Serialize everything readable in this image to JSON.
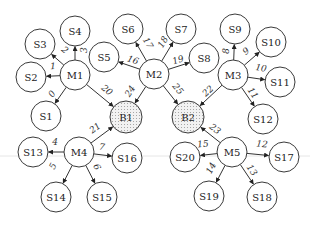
{
  "diagram": {
    "type": "network-topology",
    "nodes": [
      {
        "id": "M1",
        "label": "M1",
        "kind": "master",
        "x": 75,
        "y": 75,
        "r": 15
      },
      {
        "id": "M2",
        "label": "M2",
        "kind": "master",
        "x": 154,
        "y": 74,
        "r": 15
      },
      {
        "id": "M3",
        "label": "M3",
        "kind": "master",
        "x": 233,
        "y": 75,
        "r": 15
      },
      {
        "id": "M4",
        "label": "M4",
        "kind": "master",
        "x": 79,
        "y": 152,
        "r": 15
      },
      {
        "id": "M5",
        "label": "M5",
        "kind": "master",
        "x": 232,
        "y": 152,
        "r": 15
      },
      {
        "id": "B1",
        "label": "B1",
        "kind": "hub",
        "x": 126,
        "y": 117,
        "r": 16
      },
      {
        "id": "B2",
        "label": "B2",
        "kind": "hub",
        "x": 188,
        "y": 117,
        "r": 16
      },
      {
        "id": "S1",
        "label": "S1",
        "kind": "slave",
        "x": 46,
        "y": 116,
        "r": 15
      },
      {
        "id": "S2",
        "label": "S2",
        "kind": "slave",
        "x": 31,
        "y": 77,
        "r": 15
      },
      {
        "id": "S3",
        "label": "S3",
        "kind": "slave",
        "x": 40,
        "y": 44,
        "r": 15
      },
      {
        "id": "S4",
        "label": "S4",
        "kind": "slave",
        "x": 75,
        "y": 31,
        "r": 15
      },
      {
        "id": "S5",
        "label": "S5",
        "kind": "slave",
        "x": 104,
        "y": 57,
        "r": 15
      },
      {
        "id": "S6",
        "label": "S6",
        "kind": "slave",
        "x": 128,
        "y": 29,
        "r": 15
      },
      {
        "id": "S7",
        "label": "S7",
        "kind": "slave",
        "x": 181,
        "y": 29,
        "r": 15
      },
      {
        "id": "S8",
        "label": "S8",
        "kind": "slave",
        "x": 204,
        "y": 58,
        "r": 15
      },
      {
        "id": "S9",
        "label": "S9",
        "kind": "slave",
        "x": 235,
        "y": 29,
        "r": 15
      },
      {
        "id": "S10",
        "label": "S10",
        "kind": "slave",
        "x": 271,
        "y": 42,
        "r": 15
      },
      {
        "id": "S11",
        "label": "S11",
        "kind": "slave",
        "x": 280,
        "y": 82,
        "r": 15
      },
      {
        "id": "S12",
        "label": "S12",
        "kind": "slave",
        "x": 263,
        "y": 119,
        "r": 15
      },
      {
        "id": "S13",
        "label": "S13",
        "kind": "slave",
        "x": 33,
        "y": 152,
        "r": 15
      },
      {
        "id": "S14",
        "label": "S14",
        "kind": "slave",
        "x": 56,
        "y": 197,
        "r": 15
      },
      {
        "id": "S15",
        "label": "S15",
        "kind": "slave",
        "x": 102,
        "y": 197,
        "r": 15
      },
      {
        "id": "S16",
        "label": "S16",
        "kind": "slave",
        "x": 127,
        "y": 158,
        "r": 15
      },
      {
        "id": "S17",
        "label": "S17",
        "kind": "slave",
        "x": 284,
        "y": 157,
        "r": 15
      },
      {
        "id": "S18",
        "label": "S18",
        "kind": "slave",
        "x": 262,
        "y": 197,
        "r": 15
      },
      {
        "id": "S19",
        "label": "S19",
        "kind": "slave",
        "x": 209,
        "y": 196,
        "r": 15
      },
      {
        "id": "S20",
        "label": "S20",
        "kind": "slave",
        "x": 185,
        "y": 157,
        "r": 15
      }
    ],
    "edges": [
      {
        "label": "0",
        "from": "M1",
        "to": "S1",
        "lx": 52,
        "ly": 94
      },
      {
        "label": "1",
        "from": "M1",
        "to": "S2",
        "lx": 53,
        "ly": 66
      },
      {
        "label": "2",
        "from": "M1",
        "to": "S3",
        "lx": 65,
        "ly": 50
      },
      {
        "label": "3",
        "from": "M1",
        "to": "S4",
        "lx": 84,
        "ly": 50
      },
      {
        "label": "4",
        "from": "M4",
        "to": "S13",
        "lx": 55,
        "ly": 142
      },
      {
        "label": "5",
        "from": "M4",
        "to": "S14",
        "lx": 53,
        "ly": 166
      },
      {
        "label": "6",
        "from": "M4",
        "to": "S15",
        "lx": 97,
        "ly": 167
      },
      {
        "label": "7",
        "from": "M4",
        "to": "S16",
        "lx": 102,
        "ly": 147
      },
      {
        "label": "8",
        "from": "M3",
        "to": "S9",
        "lx": 226,
        "ly": 51
      },
      {
        "label": "9",
        "from": "M3",
        "to": "S10",
        "lx": 246,
        "ly": 51
      },
      {
        "label": "10",
        "from": "M3",
        "to": "S11",
        "lx": 261,
        "ly": 68
      },
      {
        "label": "11",
        "from": "M3",
        "to": "S12",
        "lx": 253,
        "ly": 93
      },
      {
        "label": "12",
        "from": "M5",
        "to": "S17",
        "lx": 262,
        "ly": 144
      },
      {
        "label": "13",
        "from": "M5",
        "to": "S18",
        "lx": 252,
        "ly": 170
      },
      {
        "label": "14",
        "from": "M5",
        "to": "S19",
        "lx": 211,
        "ly": 168
      },
      {
        "label": "15",
        "from": "M5",
        "to": "S20",
        "lx": 203,
        "ly": 144
      },
      {
        "label": "16",
        "from": "M2",
        "to": "S5",
        "lx": 133,
        "ly": 60
      },
      {
        "label": "17",
        "from": "M2",
        "to": "S6",
        "lx": 148,
        "ly": 43
      },
      {
        "label": "18",
        "from": "M2",
        "to": "S7",
        "lx": 163,
        "ly": 42
      },
      {
        "label": "19",
        "from": "M2",
        "to": "S8",
        "lx": 178,
        "ly": 60
      },
      {
        "label": "20",
        "from": "M1",
        "to": "B1",
        "lx": 107,
        "ly": 90
      },
      {
        "label": "21",
        "from": "M4",
        "to": "B1",
        "lx": 95,
        "ly": 128
      },
      {
        "label": "22",
        "from": "M3",
        "to": "B2",
        "lx": 208,
        "ly": 91
      },
      {
        "label": "23",
        "from": "M5",
        "to": "B2",
        "lx": 215,
        "ly": 129
      },
      {
        "label": "24",
        "from": "M2",
        "to": "B1",
        "lx": 130,
        "ly": 91
      },
      {
        "label": "25",
        "from": "M2",
        "to": "B2",
        "lx": 178,
        "ly": 89
      }
    ],
    "colors": {
      "stroke": "#3a3a3a",
      "hub_fill": "#e8e8e8",
      "background": "#ffffff"
    }
  }
}
